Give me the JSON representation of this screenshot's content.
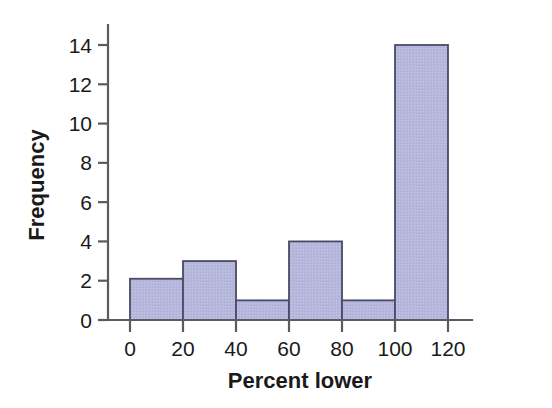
{
  "chart_data": {
    "type": "bar",
    "title": "",
    "subtitle": "",
    "xlabel": "Percent lower",
    "ylabel": "Frequency",
    "xlim": [
      0,
      120
    ],
    "ylim": [
      0,
      14
    ],
    "xticks": [
      0,
      20,
      40,
      60,
      80,
      100,
      120
    ],
    "xtick_labels": [
      "0",
      "20",
      "40",
      "60",
      "80",
      "100",
      "120"
    ],
    "yticks": [
      0,
      2,
      4,
      6,
      8,
      10,
      12,
      14
    ],
    "ytick_labels": [
      "0",
      "2",
      "4",
      "6",
      "8",
      "10",
      "12",
      "14"
    ],
    "grid": false,
    "legend": null,
    "bin_width": 20,
    "bin_edges": [
      0,
      20,
      40,
      60,
      80,
      100,
      120
    ],
    "categories": [
      "0-20",
      "20-40",
      "40-60",
      "60-80",
      "80-100",
      "100-120"
    ],
    "values": [
      2.1,
      3,
      1,
      4,
      1,
      14
    ],
    "bar_fill_color": "#b5b8dc",
    "bar_edge_color": "#4a4a66",
    "axis_color": "#5a5a62",
    "background_color": "#ffffff",
    "annotations": []
  },
  "axis": {
    "x_label": "Percent lower",
    "y_label": "Frequency"
  }
}
